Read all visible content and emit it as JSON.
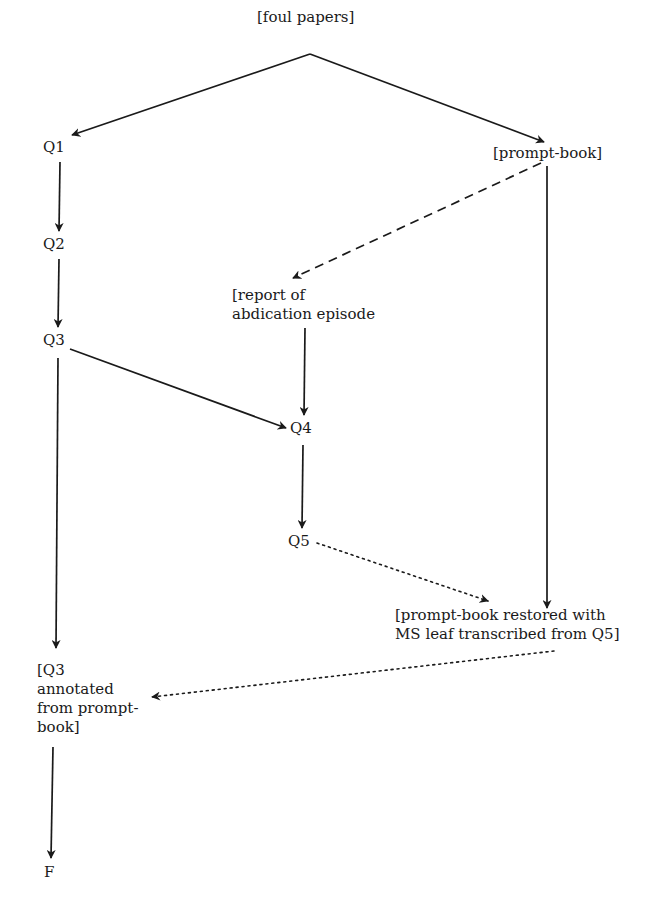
{
  "diagram": {
    "type": "stemma",
    "colors": {
      "ink": "#1a1a1a",
      "background": "#ffffff"
    },
    "nodes": [
      {
        "id": "foul_papers",
        "label": "[foul papers]"
      },
      {
        "id": "q1",
        "label": "Q1"
      },
      {
        "id": "prompt_book",
        "label": "[prompt-book]"
      },
      {
        "id": "q2",
        "label": "Q2"
      },
      {
        "id": "report",
        "label": "[report of\nabdication episode"
      },
      {
        "id": "q3",
        "label": "Q3"
      },
      {
        "id": "q4",
        "label": "Q4"
      },
      {
        "id": "q5",
        "label": "Q5"
      },
      {
        "id": "prompt_book_restored",
        "label": "[prompt-book restored with\nMS leaf transcribed from Q5]"
      },
      {
        "id": "q3_annotated",
        "label": "[Q3\nannotated\nfrom prompt-\nbook]"
      },
      {
        "id": "f",
        "label": "F"
      }
    ],
    "edges": [
      {
        "from": "foul_papers",
        "to": "q1",
        "style": "solid"
      },
      {
        "from": "foul_papers",
        "to": "prompt_book",
        "style": "solid"
      },
      {
        "from": "q1",
        "to": "q2",
        "style": "solid"
      },
      {
        "from": "q2",
        "to": "q3",
        "style": "solid"
      },
      {
        "from": "prompt_book",
        "to": "report",
        "style": "dashed"
      },
      {
        "from": "report",
        "to": "q4",
        "style": "solid"
      },
      {
        "from": "q3",
        "to": "q4",
        "style": "solid"
      },
      {
        "from": "q4",
        "to": "q5",
        "style": "solid"
      },
      {
        "from": "prompt_book",
        "to": "prompt_book_restored",
        "style": "solid"
      },
      {
        "from": "q5",
        "to": "prompt_book_restored",
        "style": "dotted"
      },
      {
        "from": "q3",
        "to": "q3_annotated",
        "style": "solid"
      },
      {
        "from": "prompt_book_restored",
        "to": "q3_annotated",
        "style": "dotted"
      },
      {
        "from": "q3_annotated",
        "to": "f",
        "style": "solid"
      }
    ]
  }
}
